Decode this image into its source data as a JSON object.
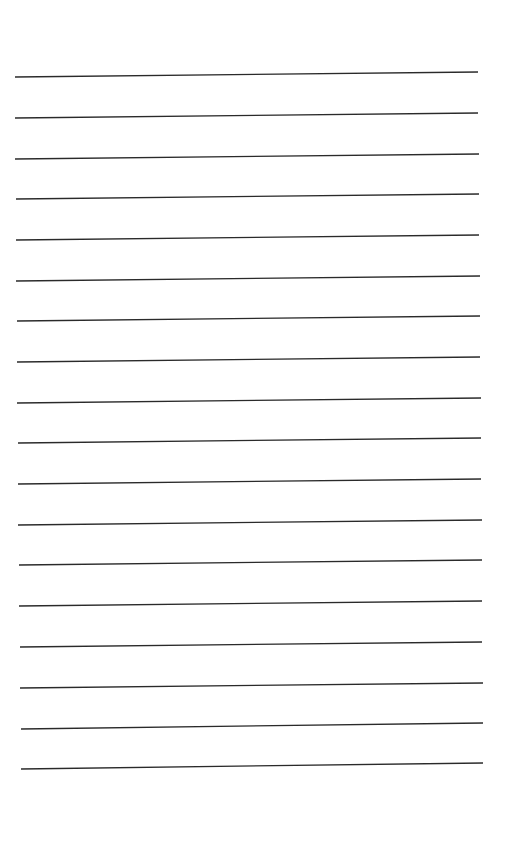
{
  "page": {
    "type": "blank lined paper",
    "line_count": 18,
    "line_color": "#2a2a2a",
    "background": "#ffffff",
    "lines": [
      {
        "x1": 15,
        "y1": 77,
        "x2": 478,
        "y2": 72
      },
      {
        "x1": 15,
        "y1": 118,
        "x2": 478,
        "y2": 113
      },
      {
        "x1": 15,
        "y1": 159,
        "x2": 479,
        "y2": 154
      },
      {
        "x1": 16,
        "y1": 199,
        "x2": 479,
        "y2": 194
      },
      {
        "x1": 16,
        "y1": 240,
        "x2": 479,
        "y2": 235
      },
      {
        "x1": 16,
        "y1": 281,
        "x2": 480,
        "y2": 276
      },
      {
        "x1": 17,
        "y1": 321,
        "x2": 480,
        "y2": 316
      },
      {
        "x1": 17,
        "y1": 362,
        "x2": 480,
        "y2": 357
      },
      {
        "x1": 17,
        "y1": 403,
        "x2": 481,
        "y2": 398
      },
      {
        "x1": 18,
        "y1": 443,
        "x2": 481,
        "y2": 438
      },
      {
        "x1": 18,
        "y1": 484,
        "x2": 481,
        "y2": 479
      },
      {
        "x1": 18,
        "y1": 525,
        "x2": 482,
        "y2": 520
      },
      {
        "x1": 19,
        "y1": 565,
        "x2": 482,
        "y2": 560
      },
      {
        "x1": 19,
        "y1": 606,
        "x2": 482,
        "y2": 601
      },
      {
        "x1": 20,
        "y1": 647,
        "x2": 482,
        "y2": 642
      },
      {
        "x1": 20,
        "y1": 688,
        "x2": 483,
        "y2": 683
      },
      {
        "x1": 21,
        "y1": 729,
        "x2": 483,
        "y2": 723
      },
      {
        "x1": 21,
        "y1": 769,
        "x2": 483,
        "y2": 763
      }
    ]
  }
}
